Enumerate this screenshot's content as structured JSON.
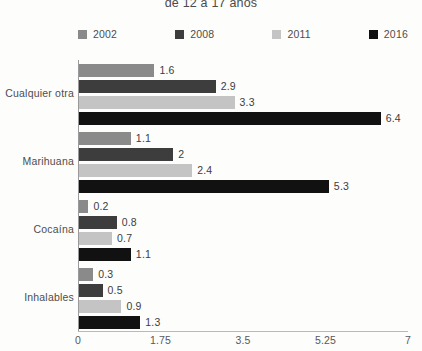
{
  "chart_data": {
    "type": "bar",
    "orientation": "horizontal",
    "title": "de 12 a 17 años",
    "xlabel": "",
    "ylabel": "",
    "xlim": [
      0,
      7
    ],
    "xticks": [
      "0",
      "1.75",
      "3.5",
      "5.25",
      "7"
    ],
    "xtick_values": [
      0,
      1.75,
      3.5,
      5.25,
      7
    ],
    "grid": false,
    "legend_position": "top",
    "categories": [
      "Cualquier otra",
      "Marihuana",
      "Cocaína",
      "Inhalables"
    ],
    "series": [
      {
        "name": "2002",
        "color": "#8a8a8a",
        "values": [
          1.6,
          1.1,
          0.2,
          0.3
        ],
        "labels": [
          "1.6",
          "1.1",
          "0.2",
          "0.3"
        ]
      },
      {
        "name": "2008",
        "color": "#3d3d3d",
        "values": [
          2.9,
          2,
          0.8,
          0.5
        ],
        "labels": [
          "2.9",
          "2",
          "0.8",
          "0.5"
        ]
      },
      {
        "name": "2011",
        "color": "#c4c4c4",
        "values": [
          3.3,
          2.4,
          0.7,
          0.9
        ],
        "labels": [
          "3.3",
          "2.4",
          "0.7",
          "0.9"
        ]
      },
      {
        "name": "2016",
        "color": "#111111",
        "values": [
          6.4,
          5.3,
          1.1,
          1.3
        ],
        "labels": [
          "6.4",
          "5.3",
          "1.1",
          "1.3"
        ]
      }
    ]
  }
}
